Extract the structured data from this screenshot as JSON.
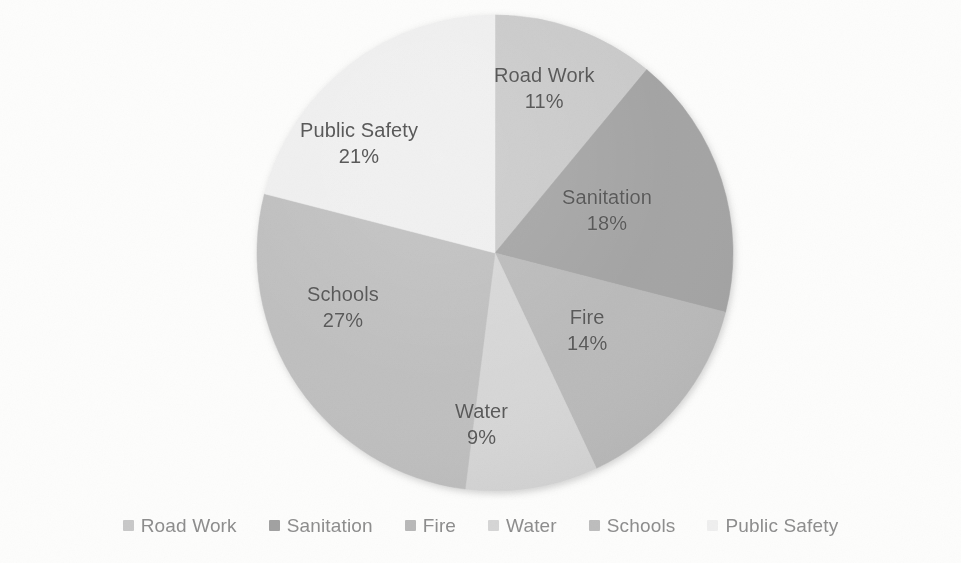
{
  "chart_data": {
    "type": "pie",
    "title": "",
    "subtitle": "",
    "xlabel": "",
    "ylabel": "",
    "grid": false,
    "legend_position": "bottom",
    "units": "percent",
    "start_angle_deg": 0,
    "direction": "clockwise",
    "categories": [
      "Road Work",
      "Sanitation",
      "Fire",
      "Water",
      "Schools",
      "Public Safety"
    ],
    "values": [
      11,
      18,
      14,
      9,
      27,
      21
    ],
    "labels": [
      "11%",
      "18%",
      "14%",
      "9%",
      "27%",
      "21%"
    ],
    "colors": [
      "#c9c9c9",
      "#a2a2a2",
      "#b9b9b9",
      "#d6d6d6",
      "#bebebe",
      "#efefef"
    ],
    "slices": [
      {
        "name": "Road Work",
        "value": 11,
        "pct_label": "11%",
        "color": "#c9c9c9",
        "start_deg": 0,
        "end_deg": 39.6,
        "label_left": 494,
        "label_top": 62
      },
      {
        "name": "Sanitation",
        "value": 18,
        "pct_label": "18%",
        "color": "#a2a2a2",
        "start_deg": 39.6,
        "end_deg": 104.4,
        "label_left": 562,
        "label_top": 184
      },
      {
        "name": "Fire",
        "value": 14,
        "pct_label": "14%",
        "color": "#b9b9b9",
        "start_deg": 104.4,
        "end_deg": 154.8,
        "label_left": 567,
        "label_top": 304
      },
      {
        "name": "Water",
        "value": 9,
        "pct_label": "9%",
        "color": "#d6d6d6",
        "start_deg": 154.8,
        "end_deg": 187.2,
        "label_left": 455,
        "label_top": 398
      },
      {
        "name": "Schools",
        "value": 27,
        "pct_label": "27%",
        "color": "#bebebe",
        "start_deg": 187.2,
        "end_deg": 284.4,
        "label_left": 307,
        "label_top": 281
      },
      {
        "name": "Public Safety",
        "value": 21,
        "pct_label": "21%",
        "color": "#efefef",
        "start_deg": 284.4,
        "end_deg": 360,
        "label_left": 300,
        "label_top": 117
      }
    ],
    "geometry": {
      "center_x": 495,
      "center_y": 253,
      "radius": 238
    }
  },
  "legend": {
    "items": [
      {
        "label": "Road Work",
        "color": "#c9c9c9"
      },
      {
        "label": "Sanitation",
        "color": "#a2a2a2"
      },
      {
        "label": "Fire",
        "color": "#b9b9b9"
      },
      {
        "label": "Water",
        "color": "#d6d6d6"
      },
      {
        "label": "Schools",
        "color": "#bebebe"
      },
      {
        "label": "Public Safety",
        "color": "#efefef"
      }
    ]
  },
  "style": {
    "background": "#fdfdfc",
    "label_color": "#5a5a5a",
    "legend_text_color": "#8e8e8e"
  }
}
